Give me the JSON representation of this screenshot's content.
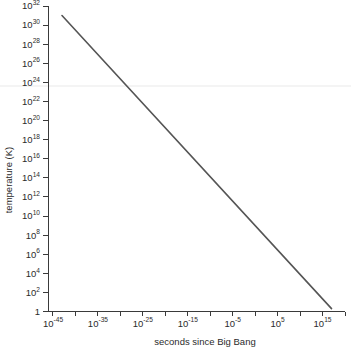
{
  "chart_data": {
    "type": "line",
    "title": "",
    "xlabel": "seconds since Big Bang",
    "ylabel": "temperature (K)",
    "xscale": "log",
    "yscale": "log",
    "xlim_exp": [
      -46,
      20
    ],
    "ylim_exp": [
      0,
      32
    ],
    "grid": false,
    "legend": null,
    "x_tick_labels": [
      "10⁻⁴⁵",
      "10⁻³⁵",
      "10⁻²⁵",
      "10⁻¹⁵",
      "10⁻⁵",
      "10⁵",
      "10¹⁵"
    ],
    "x_tick_mantissas": [
      "10",
      "10",
      "10",
      "10",
      "10",
      "10",
      "10"
    ],
    "x_tick_exponents": [
      "-45",
      "-35",
      "-25",
      "-15",
      "-5",
      "5",
      "15"
    ],
    "x_tick_exp_values": [
      -45,
      -35,
      -25,
      -15,
      -5,
      5,
      15
    ],
    "x_minor_tick_exp_values": [
      -45,
      -40,
      -35,
      -30,
      -25,
      -20,
      -15,
      -10,
      -5,
      0,
      5,
      10,
      15,
      20
    ],
    "y_tick_labels": [
      "1",
      "10²",
      "10⁴",
      "10⁶",
      "10⁸",
      "10¹⁰",
      "10¹²",
      "10¹⁴",
      "10¹⁶",
      "10¹⁸",
      "10²⁰",
      "10²²",
      "10²⁴",
      "10²⁶",
      "10²⁸",
      "10³⁰",
      "10³²"
    ],
    "y_tick_mantissas": [
      "1",
      "10",
      "10",
      "10",
      "10",
      "10",
      "10",
      "10",
      "10",
      "10",
      "10",
      "10",
      "10",
      "10",
      "10",
      "10",
      "10"
    ],
    "y_tick_exponents": [
      "",
      "2",
      "4",
      "6",
      "8",
      "10",
      "12",
      "14",
      "16",
      "18",
      "20",
      "22",
      "24",
      "26",
      "28",
      "30",
      "32"
    ],
    "y_tick_exp_values": [
      0,
      2,
      4,
      6,
      8,
      10,
      12,
      14,
      16,
      18,
      20,
      22,
      24,
      26,
      28,
      30,
      32
    ],
    "series": [
      {
        "name": "cooling of the universe",
        "x_exp": [
          -43.0,
          17.0
        ],
        "y_exp": [
          31.0,
          0.3
        ],
        "color": "#555555"
      }
    ],
    "annotations": []
  },
  "figure": {
    "background_color": "#ffffff",
    "axis_color": "#3a3a3a",
    "text_color": "#2b2b2b",
    "artifact_color": "#f1f1f1"
  }
}
